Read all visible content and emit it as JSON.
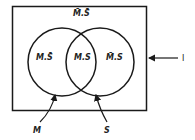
{
  "diagram": {
    "type": "venn",
    "universe_label": "I",
    "sets": [
      {
        "name": "M",
        "label": "M"
      },
      {
        "name": "S",
        "label": "S"
      }
    ],
    "regions": {
      "outside": "M̄.S̄",
      "m_only": "M.S̄",
      "intersection": "M.S",
      "s_only": "M̄.S"
    },
    "stroke_color": "#1a1a1a"
  }
}
